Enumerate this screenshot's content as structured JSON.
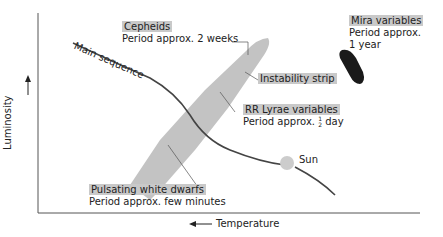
{
  "axes": {
    "y_label": "Luminosity",
    "y_arrow": "→",
    "x_label": "Temperature",
    "x_arrow": "←"
  },
  "labels": {
    "main_sequence": "Main sequence",
    "cepheids": {
      "title": "Cepheids",
      "period": "Period approx. 2 weeks"
    },
    "mira": {
      "title": "Mira variables",
      "period_line1": "Period approx.",
      "period_line2": "1 year"
    },
    "instability_strip": "Instability strip",
    "rr_lyrae": {
      "title": "RR Lyrae variables",
      "period_prefix": "Period approx.",
      "period_num": "1",
      "period_den": "2",
      "period_suffix": "day"
    },
    "sun": "Sun",
    "white_dwarfs": {
      "title": "Pulsating white dwarfs",
      "period": "Period approx. few minutes"
    }
  },
  "colors": {
    "highlight": "#c9c9c9",
    "strip": "#bdbdbd",
    "line": "#444444",
    "mira": "#1a1a1a"
  }
}
